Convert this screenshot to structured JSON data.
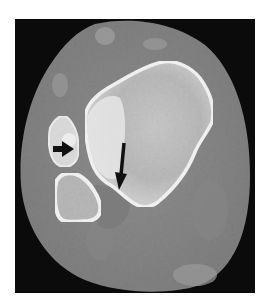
{
  "image": {
    "description": "Axial CT slice of a limb cross-section with two black arrows indicating findings",
    "modality": "CT (axial, bone window)",
    "background_color": "#ffffff",
    "frame_color": "#0b0b0b",
    "soft_tissue_color": "#8a8a8a",
    "bone_cortex_color": "#f2f2f2",
    "bone_marrow_color": "#bdbdbd",
    "annotations": [
      {
        "type": "arrow",
        "direction": "right",
        "name": "short-arrow",
        "color": "#111111"
      },
      {
        "type": "arrow",
        "direction": "down",
        "name": "long-arrow",
        "color": "#111111"
      }
    ]
  }
}
